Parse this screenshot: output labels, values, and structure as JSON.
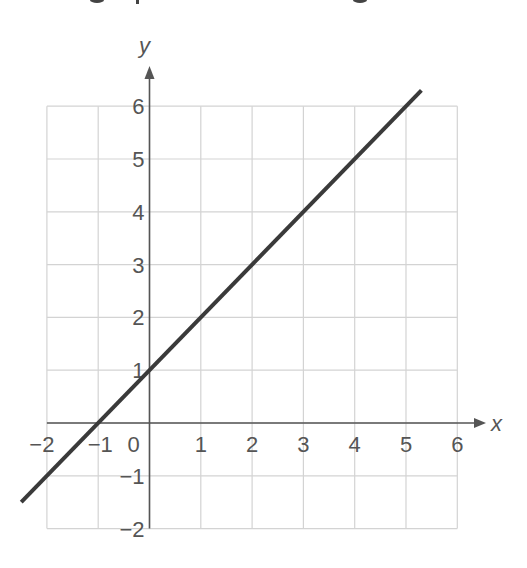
{
  "chart_data": {
    "type": "line",
    "title": "",
    "xlabel": "x",
    "ylabel": "y",
    "xlim": [
      -2,
      6
    ],
    "ylim": [
      -2,
      6
    ],
    "grid": true,
    "x_ticks": [
      "−2",
      "−1",
      "0",
      "1",
      "2",
      "3",
      "4",
      "5",
      "6"
    ],
    "y_ticks": [
      "6",
      "5",
      "4",
      "3",
      "2",
      "1",
      "−1",
      "−2"
    ],
    "series": [
      {
        "name": "y = x + 1",
        "equation": "y = x + 1",
        "x": [
          -2.5,
          -1,
          0,
          1,
          2,
          3,
          4,
          5,
          5.3
        ],
        "y": [
          -1.5,
          0,
          1,
          2,
          3,
          4,
          5,
          6,
          6.3
        ],
        "color": "#3a3a3a"
      }
    ]
  },
  "colors": {
    "line": "#3a3a3a",
    "grid": "#d3d3d3",
    "axis": "#555555",
    "text": "#555555"
  }
}
